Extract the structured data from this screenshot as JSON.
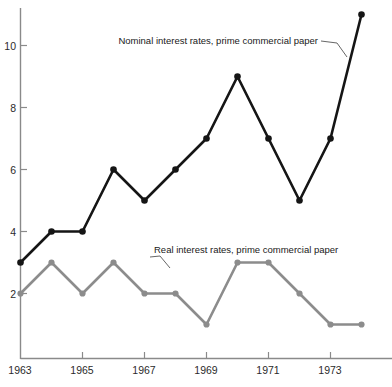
{
  "chart_data": {
    "type": "line",
    "title": "",
    "subtitle": "",
    "xlabel": "",
    "ylabel": "",
    "x": [
      1963,
      1964,
      1965,
      1966,
      1967,
      1968,
      1969,
      1970,
      1971,
      1972,
      1973,
      1974
    ],
    "categories": [
      "1963",
      "1964",
      "1965",
      "1966",
      "1967",
      "1968",
      "1969",
      "1970",
      "1971",
      "1972",
      "1973",
      "1974"
    ],
    "series": [
      {
        "name": "Nominal interest rates, prime commercial paper",
        "color": "#151515",
        "values": [
          3,
          4,
          4,
          6,
          5,
          6,
          7,
          9,
          7,
          5,
          7,
          11
        ]
      },
      {
        "name": "Real interest rates, prime commercial paper",
        "color": "#8c8c8c",
        "values": [
          2,
          3,
          2,
          3,
          2,
          2,
          1,
          3,
          3,
          2,
          1,
          1
        ]
      }
    ],
    "xlim": [
      1963,
      1975
    ],
    "ylim": [
      0,
      11.6
    ],
    "xticks": [
      1963,
      1965,
      1967,
      1969,
      1971,
      1973
    ],
    "xtick_labels": [
      "1963",
      "1965",
      "1967",
      "1969",
      "1971",
      "1973"
    ],
    "yticks": [
      2,
      4,
      6,
      8,
      10
    ],
    "ytick_labels": [
      "2",
      "4",
      "6",
      "8",
      "10"
    ],
    "grid": false,
    "legend": "none",
    "annotations": [
      {
        "text": "Nominal interest rates, prime commercial paper",
        "target_series": "Nominal interest rates, prime commercial paper"
      },
      {
        "text": "Real interest rates, prime commercial paper",
        "target_series": "Real interest rates, prime commercial paper"
      }
    ]
  },
  "axes": {
    "y_ticks": [
      {
        "label": "10",
        "value": 10
      },
      {
        "label": "8",
        "value": 8
      },
      {
        "label": "6",
        "value": 6
      },
      {
        "label": "4",
        "value": 4
      },
      {
        "label": "2",
        "value": 2
      }
    ],
    "x_ticks": [
      {
        "label": "1963",
        "value": 1963
      },
      {
        "label": "1965",
        "value": 1965
      },
      {
        "label": "1967",
        "value": 1967
      },
      {
        "label": "1969",
        "value": 1969
      },
      {
        "label": "1971",
        "value": 1971
      },
      {
        "label": "1973",
        "value": 1973
      }
    ]
  },
  "labels": {
    "nominal": "Nominal interest rates, prime commercial paper",
    "real": "Real interest rates, prime commercial paper"
  },
  "colors": {
    "nominal_line": "#151515",
    "real_line": "#8c8c8c",
    "axis": "#8a8a8a",
    "text": "#2b2b2b",
    "background": "#ffffff"
  }
}
